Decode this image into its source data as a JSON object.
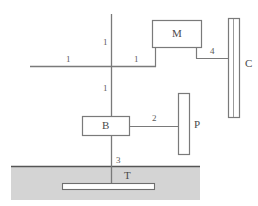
{
  "diagram": {
    "style": {
      "line_color": "#6e6e6e",
      "box_fill": "#ffffff",
      "ground_fill": "#d4d4d4",
      "ground_top_border": "#555555",
      "text_color": "#555555",
      "background": "#ffffff"
    },
    "components": [
      {
        "id": "mass-box-m",
        "label": "M",
        "shape": "rectangle",
        "x": 152,
        "y": 20,
        "width": 50,
        "height": 28
      },
      {
        "id": "box-b",
        "label": "B",
        "shape": "rectangle",
        "x": 82,
        "y": 116,
        "width": 48,
        "height": 20
      },
      {
        "id": "plate-c",
        "label": "C",
        "shape": "double-line-vertical-plate",
        "x": 228,
        "y": 18,
        "width": 12,
        "height": 100
      },
      {
        "id": "plate-p",
        "label": "P",
        "shape": "vertical-plate",
        "x": 178,
        "y": 93,
        "width": 12,
        "height": 62
      },
      {
        "id": "buried-plate-t",
        "label": "T",
        "shape": "horizontal-bar",
        "x": 62,
        "y": 183,
        "width": 93,
        "height": 7
      },
      {
        "id": "ground-region",
        "label": "",
        "shape": "filled-region",
        "x": 11,
        "y": 166,
        "width": 189,
        "height": 34
      }
    ],
    "lines": [
      {
        "id": "vertical-mast",
        "x1": 111,
        "y1": 14,
        "x2": 111,
        "y2": 190
      },
      {
        "id": "horizontal-beam",
        "x1": 30,
        "y1": 66,
        "x2": 155,
        "y2": 66
      },
      {
        "id": "m-left-leg",
        "x1": 155,
        "y1": 48,
        "x2": 155,
        "y2": 66
      },
      {
        "id": "m-right-leg-down",
        "x1": 196,
        "y1": 48,
        "x2": 196,
        "y2": 58
      },
      {
        "id": "m-right-leg-across",
        "x1": 196,
        "y1": 58,
        "x2": 230,
        "y2": 58
      },
      {
        "id": "b-to-p-link",
        "x1": 130,
        "y1": 126,
        "x2": 179,
        "y2": 126
      }
    ],
    "annotations": [
      {
        "id": "label-1-upper-left",
        "text": "1",
        "x": 103,
        "y": 38
      },
      {
        "id": "label-1-beam-right",
        "text": "1",
        "x": 134,
        "y": 55
      },
      {
        "id": "label-1-beam-left",
        "text": "1",
        "x": 66,
        "y": 55
      },
      {
        "id": "label-1-lower",
        "text": "1",
        "x": 103,
        "y": 84
      },
      {
        "id": "label-2-link",
        "text": "2",
        "x": 152,
        "y": 114
      },
      {
        "id": "label-3-mast",
        "text": "3",
        "x": 116,
        "y": 156
      },
      {
        "id": "label-4-connector",
        "text": "4",
        "x": 210,
        "y": 47
      },
      {
        "id": "label-m",
        "text": "M",
        "x": 172,
        "y": 28
      },
      {
        "id": "label-b",
        "text": "B",
        "x": 102,
        "y": 120
      },
      {
        "id": "label-c",
        "text": "C",
        "x": 245,
        "y": 58
      },
      {
        "id": "label-p",
        "text": "P",
        "x": 194,
        "y": 119
      },
      {
        "id": "label-t",
        "text": "T",
        "x": 124,
        "y": 170
      }
    ]
  }
}
